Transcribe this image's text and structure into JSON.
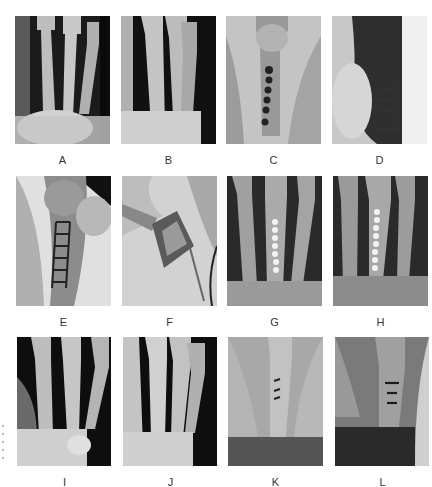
{
  "figure": {
    "panels": [
      {
        "id": "A",
        "label": "A",
        "description": "X-ray of hand metacarpals, pre-operative, PA view",
        "bg": "#1a1a1a"
      },
      {
        "id": "B",
        "label": "B",
        "description": "X-ray of hand metacarpals, oblique view",
        "bg": "#151515"
      },
      {
        "id": "C",
        "label": "C",
        "description": "Intra-operative fluoroscopy with screws in metacarpal",
        "bg": "#bdbdbd"
      },
      {
        "id": "D",
        "label": "D",
        "description": "Lateral fluoroscopy showing plate fixation",
        "bg": "#9a9a9a"
      },
      {
        "id": "E",
        "label": "E",
        "description": "Fluoroscopy showing ladder-like plate on metacarpal",
        "bg": "#a8a8a8"
      },
      {
        "id": "F",
        "label": "F",
        "description": "Intra-operative photograph of dorsal hand incision",
        "bg": "#d0d0d0"
      },
      {
        "id": "G",
        "label": "G",
        "description": "Post-operative X-ray with plate on metacarpal, PA view",
        "bg": "#2a2a2a"
      },
      {
        "id": "H",
        "label": "H",
        "description": "Post-operative X-ray with plate, oblique view",
        "bg": "#2a2a2a"
      },
      {
        "id": "I",
        "label": "I",
        "description": "Follow-up X-ray of hand, PA view",
        "bg": "#111111"
      },
      {
        "id": "J",
        "label": "J",
        "description": "Follow-up X-ray of hand, oblique view",
        "bg": "#111111"
      },
      {
        "id": "K",
        "label": "K",
        "description": "Follow-up fluoroscopy with residual fixation marks",
        "bg": "#9c9c9c"
      },
      {
        "id": "L",
        "label": "L",
        "description": "Follow-up lateral fluoroscopy with fixation marks",
        "bg": "#6a6a6a"
      }
    ]
  }
}
